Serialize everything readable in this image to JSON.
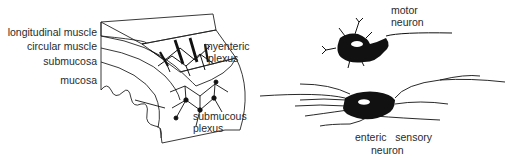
{
  "left_panel": {
    "labels": {
      "longitudinal_muscle": "longitudinal muscle",
      "circular_muscle": "circular muscle",
      "submucosa": "submucosa",
      "mucosa": "mucosa",
      "myenteric_line1": "myenteric",
      "myenteric_line2": "plexus",
      "submucous_line1": "submucous",
      "submucous_line2": "plexus"
    }
  },
  "right_panel": {
    "motor_neuron": {
      "line1": "motor",
      "line2": "neuron"
    },
    "enteric_sensory_neuron": {
      "line1": "enteric   sensory",
      "line2": "neuron"
    }
  }
}
